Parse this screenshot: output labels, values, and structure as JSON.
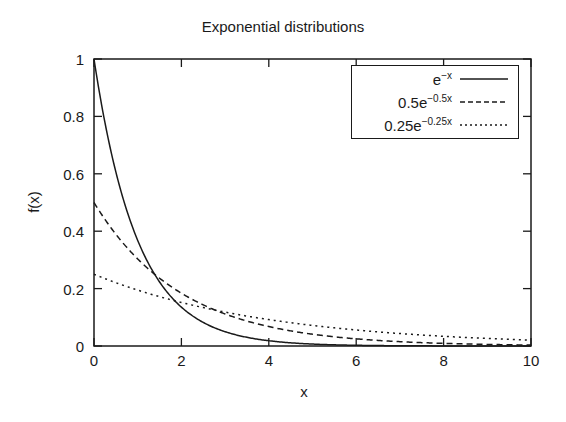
{
  "chart_data": {
    "type": "line",
    "title": "Exponential distributions",
    "xlabel": "x",
    "ylabel": "f(x)",
    "xlim": [
      0,
      10
    ],
    "ylim": [
      0,
      1
    ],
    "xticks": [
      0,
      2,
      4,
      6,
      8,
      10
    ],
    "yticks": [
      0,
      0.2,
      0.4,
      0.6,
      0.8,
      1
    ],
    "xtick_labels": [
      "0",
      "2",
      "4",
      "6",
      "8",
      "10"
    ],
    "ytick_labels": [
      "0",
      "0.2",
      "0.4",
      "0.6",
      "0.8",
      "1"
    ],
    "grid": false,
    "legend_position": "upper right",
    "x": [
      0,
      0.5,
      1,
      1.5,
      2,
      3,
      4,
      5,
      6,
      7,
      8,
      9,
      10
    ],
    "series": [
      {
        "name": "e^-x",
        "label_base": "e",
        "label_exp": "−x",
        "style": "solid",
        "formula": "exp(-x)",
        "values": [
          1.0,
          0.607,
          0.368,
          0.223,
          0.135,
          0.05,
          0.018,
          0.007,
          0.002,
          0.001,
          0.0003,
          0.0001,
          5e-05
        ]
      },
      {
        "name": "0.5e^-0.5x",
        "label_base": "0.5e",
        "label_exp": "−0.5x",
        "style": "dashed",
        "formula": "0.5*exp(-0.5*x)",
        "values": [
          0.5,
          0.389,
          0.303,
          0.236,
          0.184,
          0.112,
          0.068,
          0.041,
          0.025,
          0.015,
          0.009,
          0.006,
          0.003
        ]
      },
      {
        "name": "0.25e^-0.25x",
        "label_base": "0.25e",
        "label_exp": "−0.25x",
        "style": "dotted",
        "formula": "0.25*exp(-0.25*x)",
        "values": [
          0.25,
          0.221,
          0.195,
          0.172,
          0.152,
          0.118,
          0.092,
          0.072,
          0.056,
          0.043,
          0.034,
          0.026,
          0.021
        ]
      }
    ]
  },
  "colors": {
    "line": "#1a1a1a",
    "background": "#ffffff"
  }
}
